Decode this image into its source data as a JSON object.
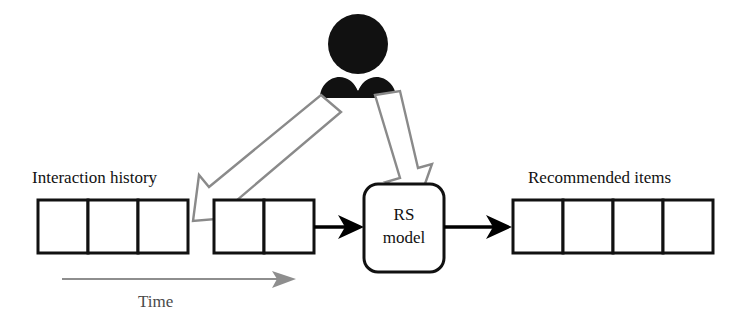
{
  "figure": {
    "type": "diagram",
    "background_color": "#ffffff"
  },
  "labels": {
    "interaction_history": "Interaction history",
    "recommended_items": "Recommended items",
    "time": "Time",
    "rs_model_line1": "RS",
    "rs_model_line2": "model"
  },
  "colors": {
    "box_stroke": "#111111",
    "block_arrow_stroke": "#8a8a8a",
    "block_arrow_fill": "#ffffff",
    "flow_arrow": "#000000",
    "time_arrow": "#8e8e8e",
    "person_fill": "#111111",
    "text": "#111111"
  },
  "groups": {
    "history_early": {
      "name": "interaction-history-early-items",
      "count": 3
    },
    "history_recent": {
      "name": "interaction-history-recent-items",
      "count": 2
    },
    "recommended": {
      "name": "recommended-items-list",
      "count": 4
    }
  },
  "icons": {
    "person": "user-icon",
    "left_block_arrow": "block-arrow-down-left-icon",
    "right_block_arrow": "block-arrow-down-right-icon",
    "flow_arrow_1": "arrow-right-icon",
    "flow_arrow_2": "arrow-right-icon",
    "time_arrow": "time-axis-arrow-icon"
  }
}
